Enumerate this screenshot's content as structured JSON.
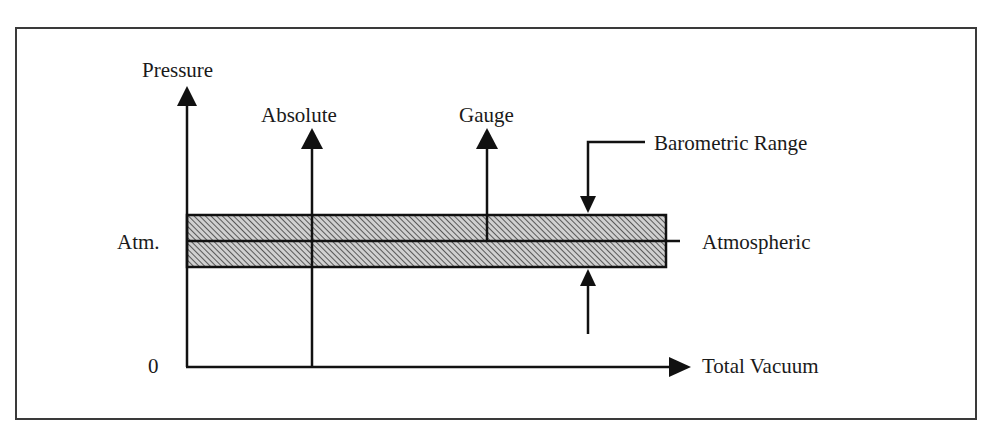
{
  "diagram": {
    "type": "pressure-reference-diagram",
    "axes": {
      "y_axis_label": "Pressure",
      "x_axis_label": "Total Vacuum",
      "origin_label": "0",
      "atm_tick_label": "Atm."
    },
    "arrows": {
      "absolute_label": "Absolute",
      "gauge_label": "Gauge"
    },
    "band": {
      "range_label": "Barometric Range",
      "line_label": "Atmospheric"
    },
    "colors": {
      "stroke": "#111111",
      "band_fill": "#bdbdbd",
      "hatch": "#333333",
      "frame": "#3a3a3a",
      "background": "#ffffff"
    }
  }
}
